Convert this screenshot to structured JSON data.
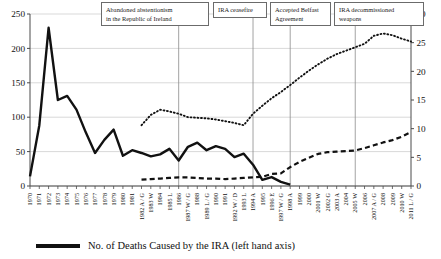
{
  "chart_data": {
    "type": "line",
    "title": "",
    "xlabel": "",
    "ylabel_left": "No. of Deaths Caused by the IRA (left hand axis)",
    "ylabel_right": "",
    "ylim_left": [
      0,
      250
    ],
    "ylim_right": [
      0,
      30
    ],
    "yticks_left": [
      0,
      50,
      100,
      150,
      200,
      250
    ],
    "yticks_right": [
      0,
      5,
      10,
      15,
      20,
      25,
      30
    ],
    "grid": true,
    "legend_position": "bottom",
    "categories": [
      "1970",
      "1971",
      "1972",
      "1973",
      "1974",
      "1975",
      "1976",
      "1977",
      "1978",
      "1979",
      "1980",
      "1981",
      "1982 A / G",
      "1983 W",
      "1984",
      "1985 L",
      "1986",
      "1987 W / G",
      "1988",
      "1989 L / G",
      "1990",
      "1991",
      "1992 W / D",
      "1993 L",
      "1994 A",
      "1995",
      "1996 E",
      "1997 W / G",
      "1998 A",
      "1999",
      "2000",
      "2001 W",
      "2002 G",
      "2003 A",
      "2004",
      "2005 W",
      "2006",
      "2007 A / G",
      "2008",
      "2009",
      "2010 W",
      "2011 L / G"
    ],
    "series": [
      {
        "name": "No. of Deaths Caused by the IRA (left hand axis)",
        "style": "solid",
        "axis": "left",
        "values": [
          14,
          88,
          230,
          125,
          131,
          111,
          78,
          48,
          67,
          82,
          44,
          52,
          48,
          43,
          46,
          54,
          37,
          57,
          63,
          52,
          58,
          54,
          42,
          47,
          31,
          9,
          13,
          6,
          2,
          null,
          null,
          null,
          null,
          null,
          null,
          null,
          null,
          null,
          null,
          null,
          null,
          null
        ]
      },
      {
        "name": "dotted-series-right-axis",
        "style": "dotted",
        "axis": "right",
        "values": [
          null,
          null,
          null,
          null,
          null,
          null,
          null,
          null,
          null,
          null,
          null,
          null,
          10.6,
          12.4,
          13.3,
          13.0,
          12.6,
          12.0,
          11.9,
          11.8,
          11.6,
          11.3,
          11.0,
          10.6,
          12.6,
          14.0,
          15.3,
          16.4,
          17.6,
          18.9,
          20.1,
          21.2,
          22.2,
          23.0,
          23.6,
          24.2,
          24.8,
          26.2,
          26.6,
          26.3,
          25.7,
          25.2
        ]
      },
      {
        "name": "dashed-series-right-axis",
        "style": "dashed",
        "axis": "right",
        "values": [
          null,
          null,
          null,
          null,
          null,
          null,
          null,
          null,
          null,
          null,
          null,
          null,
          1.1,
          1.2,
          1.3,
          1.4,
          1.5,
          1.5,
          1.4,
          1.3,
          1.3,
          1.2,
          1.3,
          1.4,
          1.5,
          1.6,
          2.1,
          2.2,
          3.3,
          4.2,
          4.9,
          5.6,
          5.9,
          6.0,
          6.1,
          6.2,
          6.6,
          7.1,
          7.6,
          8.0,
          8.6,
          9.4
        ]
      }
    ],
    "annotations": [
      {
        "id": "abandoned-abstentionism",
        "line1": "Abandoned abstentionism",
        "line2": "in the Republic of Ireland",
        "anchor_category": "1986"
      },
      {
        "id": "ira-ceasefire",
        "line1": "IRA ceasefire",
        "line2": "",
        "anchor_category": "1994 A"
      },
      {
        "id": "accepted-belfast-agreement",
        "line1": "Accepted Belfast",
        "line2": "Agreement",
        "anchor_category": "1998 A"
      },
      {
        "id": "ira-decommissioned-weapons",
        "line1": "IRA decommissioned",
        "line2": "weapons",
        "anchor_category": "2005 W"
      }
    ]
  },
  "legend": {
    "entries": [
      {
        "label": "No. of Deaths Caused by the IRA (left hand axis)",
        "style": "solid",
        "color": "#111111"
      }
    ]
  },
  "colors": {
    "line": "#111111",
    "grid": "#c9c9c9",
    "axis": "#4a4a4a",
    "box_border": "#6b6b6b",
    "text": "#111111"
  }
}
